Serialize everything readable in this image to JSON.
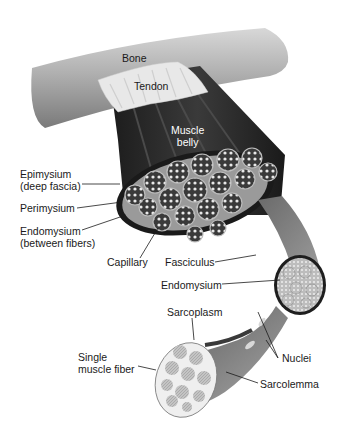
{
  "diagram": {
    "labels": {
      "bone": "Bone",
      "tendon": "Tendon",
      "muscle_belly": "Muscle\nbelly",
      "epimysium": "Epimysium\n(deep fascia)",
      "perimysium": "Perimysium",
      "endomysium_between": "Endomysium\n(between fibers)",
      "capillary": "Capillary",
      "fasciculus": "Fasciculus",
      "endomysium": "Endomysium",
      "sarcoplasm": "Sarcoplasm",
      "single_fiber": "Single\nmuscle fiber",
      "nuclei": "Nuclei",
      "sarcolemma": "Sarcolemma"
    },
    "colors": {
      "background": "#ffffff",
      "bone": "#b8b8b8",
      "tendon": "#e6e6e6",
      "muscle": "#2a2a2a",
      "fascicle_fill": "#8a8a8a",
      "fiber_fill": "#cfcfcf",
      "label_text": "#1a1a1a"
    }
  }
}
